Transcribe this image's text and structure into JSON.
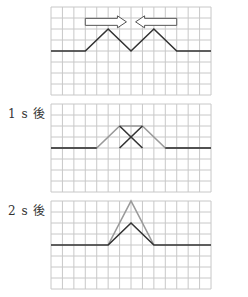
{
  "diagram": {
    "grid": {
      "cols": 14,
      "rows": 8,
      "cell_w": 11.43,
      "cell_h": 11,
      "line_color": "#c8c8c8",
      "baseline_row": 4
    },
    "colors": {
      "dark": "#333333",
      "gray": "#9a9a9a"
    },
    "panels": [
      {
        "label": "",
        "top": 7,
        "arrows": [
          {
            "direction": "right",
            "x1": 3,
            "x2": 6.6,
            "row": 1.35
          },
          {
            "direction": "left",
            "x1": 7.4,
            "x2": 11,
            "row": 1.35
          }
        ],
        "waves": [
          {
            "color": "dark",
            "points": [
              [
                0,
                4
              ],
              [
                3,
                4
              ],
              [
                5,
                2
              ],
              [
                7,
                4
              ],
              [
                9,
                2
              ],
              [
                11,
                4
              ],
              [
                14,
                4
              ]
            ]
          }
        ]
      },
      {
        "label": "1 s 後",
        "top": 104,
        "arrows": [],
        "waves": [
          {
            "color": "gray",
            "points": [
              [
                0,
                4
              ],
              [
                4,
                4
              ],
              [
                6,
                2
              ],
              [
                8,
                2
              ],
              [
                10,
                4
              ],
              [
                14,
                4
              ]
            ]
          },
          {
            "color": "dark",
            "points": [
              [
                6,
                4
              ],
              [
                8,
                2
              ]
            ]
          },
          {
            "color": "dark",
            "points": [
              [
                6,
                2
              ],
              [
                8,
                4
              ]
            ]
          },
          {
            "color": "dark",
            "points": [
              [
                0,
                4
              ],
              [
                4,
                4
              ]
            ]
          },
          {
            "color": "dark",
            "points": [
              [
                10,
                4
              ],
              [
                14,
                4
              ]
            ]
          }
        ]
      },
      {
        "label": "2 s 後",
        "top": 201,
        "arrows": [],
        "waves": [
          {
            "color": "gray",
            "points": [
              [
                5,
                4
              ],
              [
                7,
                0
              ],
              [
                9,
                4
              ]
            ]
          },
          {
            "color": "dark",
            "points": [
              [
                0,
                4
              ],
              [
                5,
                4
              ],
              [
                7,
                2
              ],
              [
                9,
                4
              ],
              [
                14,
                4
              ]
            ]
          }
        ]
      }
    ]
  },
  "labels": {
    "panel1": "",
    "panel2": "1 s 後",
    "panel3": "2 s 後"
  }
}
